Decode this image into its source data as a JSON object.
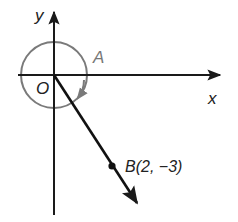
{
  "diagram": {
    "type": "angle-in-standard-position",
    "labels": {
      "y_axis": "y",
      "x_axis": "x",
      "origin": "O",
      "angle": "A",
      "point": "B(2, −3)"
    },
    "point_B": {
      "x": 2,
      "y": -3
    },
    "colors": {
      "axes": "#1a1a1a",
      "terminal_ray": "#111111",
      "angle_arc": "#7a7a7a",
      "label_dark": "#222222",
      "label_gray": "#777777"
    }
  }
}
